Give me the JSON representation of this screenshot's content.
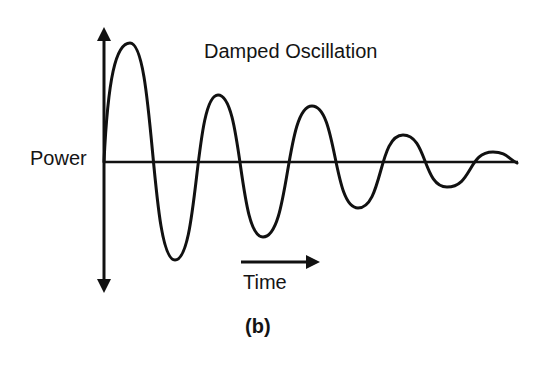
{
  "figure": {
    "title": "Damped Oscillation",
    "y_axis_label": "Power",
    "x_axis_label": "Time",
    "caption": "(b)"
  },
  "diagram": {
    "type": "damped-oscillation-sketch",
    "baseline_y": 162,
    "origin_x": 104,
    "axis": {
      "vertical": {
        "x": 104,
        "top_arrow_y": 27,
        "bottom_arrow_y": 293
      },
      "horizontal": {
        "y": 162,
        "x_start": 104,
        "x_end": 518
      }
    },
    "time_arrow": {
      "x_start": 241,
      "x_end": 320,
      "y": 262
    },
    "extrema": [
      {
        "kind": "start",
        "x": 104,
        "y": 162
      },
      {
        "kind": "peak",
        "x": 130,
        "y": 43
      },
      {
        "kind": "trough",
        "x": 175,
        "y": 260
      },
      {
        "kind": "peak",
        "x": 218,
        "y": 95
      },
      {
        "kind": "trough",
        "x": 263,
        "y": 237
      },
      {
        "kind": "peak",
        "x": 312,
        "y": 106
      },
      {
        "kind": "trough",
        "x": 358,
        "y": 208
      },
      {
        "kind": "peak",
        "x": 403,
        "y": 135
      },
      {
        "kind": "trough",
        "x": 447,
        "y": 187
      },
      {
        "kind": "peak",
        "x": 493,
        "y": 152
      },
      {
        "kind": "end",
        "x": 517,
        "y": 163
      }
    ],
    "stroke_color": "#111111",
    "background_color": "#ffffff"
  }
}
